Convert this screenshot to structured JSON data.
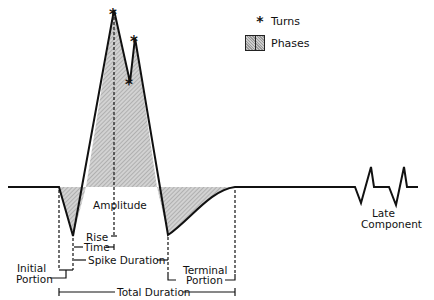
{
  "legend": {
    "turns_symbol": "*",
    "turns_label": "Turns",
    "phases_label": "Phases"
  },
  "labels": {
    "amplitude": "Amplitude",
    "rise": "Rise",
    "time": "Time",
    "spike_duration": "Spike Duration",
    "initial": "Initial",
    "portion": "Portion",
    "terminal": "Terminal",
    "terminal_portion": "Portion",
    "total_duration": "Total Duration",
    "late": "Late",
    "component": "Component"
  },
  "colors": {
    "line": "#111111",
    "shade_dark": "#999999",
    "shade_light": "#cccccc"
  }
}
